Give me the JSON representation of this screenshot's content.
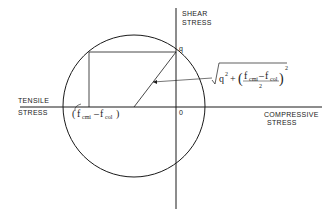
{
  "diagram": {
    "type": "mohr-circle",
    "axes": {
      "vertical_label_line1": "SHEAR",
      "vertical_label_line2": "STRESS",
      "left_label_line1": "TENSILE",
      "left_label_line2": "STRESS",
      "right_label_line1": "COMPRESSIVE",
      "right_label_line2": "STRESS",
      "origin_label": "0"
    },
    "point_label": "q",
    "intercept_label": {
      "open": "(",
      "f1": "f",
      "f1_sub": "cmi",
      "minus": "–",
      "f2": "f",
      "f2_sub": "col",
      "close": ")"
    },
    "radius_formula": {
      "q": "q",
      "q_exp": "2",
      "plus": "+",
      "open": "(",
      "f1": "f",
      "f1_sub": "cmi",
      "minus": "–",
      "f2": "f",
      "f2_sub": "col",
      "denominator": "2",
      "close": ")",
      "exp": "2"
    },
    "stroke_color": "#1a1a1a"
  }
}
